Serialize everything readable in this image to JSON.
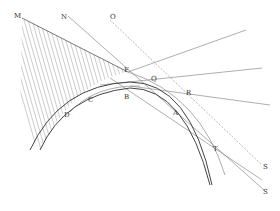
{
  "figure": {
    "labels": {
      "M": "M",
      "N": "N",
      "O": "O",
      "F": "F",
      "Q": "Q",
      "B": "B",
      "C": "C",
      "D": "D",
      "R": "R",
      "A": "A",
      "T": "T",
      "S1": "S",
      "S2": "S"
    },
    "colors": {
      "line": "#555555",
      "hatch": "#999999",
      "background": "#ffffff"
    }
  }
}
